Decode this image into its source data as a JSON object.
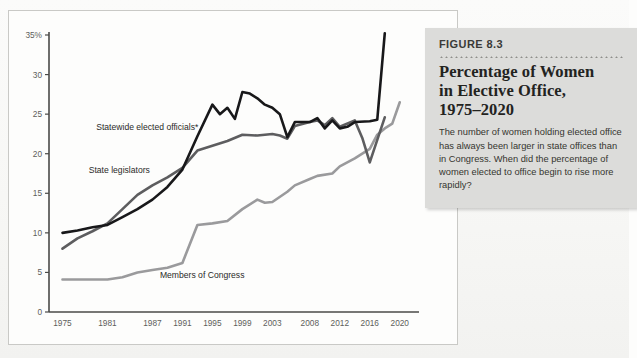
{
  "figure": {
    "label": "FIGURE 8.3",
    "title_lines": [
      "Percentage of Women",
      "in Elective Office,",
      "1975–2020"
    ],
    "caption": "The number of women holding elected office has always been larger in state offices than in Congress. When did the percentage of women elected to office begin to rise more rapidly?"
  },
  "colors": {
    "statewide": "#18181a",
    "legislators": "#5d5d5f",
    "congress": "#9a9a9c",
    "axis": "#4a4a48",
    "box_bg": "#dcdcda",
    "page_bg": "#fdfdfc"
  },
  "chart_data": {
    "type": "line",
    "xlabel": "",
    "ylabel": "",
    "ylim": [
      0,
      35
    ],
    "yticks": [
      0,
      5,
      10,
      15,
      20,
      25,
      30,
      35
    ],
    "ytick_labels": [
      "0",
      "5",
      "10",
      "15",
      "20",
      "25",
      "30",
      "35%"
    ],
    "grid": false,
    "legend": "inline-labels",
    "x": [
      1975,
      1981,
      1987,
      1991,
      1995,
      1999,
      2003,
      2008,
      2012,
      2016,
      2020
    ],
    "xtick_labels": [
      "1975",
      "1981",
      "1987",
      "1991",
      "1995",
      "1999",
      "2003",
      "2008",
      "2012",
      "2016",
      "2020"
    ],
    "series": [
      {
        "name": "Statewide elected officials*",
        "color": "#18181a",
        "label_x": 1979.5,
        "label_y": 23.0,
        "points": [
          [
            1975,
            10.0
          ],
          [
            1977,
            10.3
          ],
          [
            1979,
            10.7
          ],
          [
            1981,
            11.0
          ],
          [
            1983,
            12.0
          ],
          [
            1985,
            13.0
          ],
          [
            1987,
            14.2
          ],
          [
            1989,
            15.8
          ],
          [
            1991,
            18.0
          ],
          [
            1993,
            22.2
          ],
          [
            1995,
            26.2
          ],
          [
            1996,
            25.0
          ],
          [
            1997,
            25.8
          ],
          [
            1998,
            24.4
          ],
          [
            1999,
            27.8
          ],
          [
            2000,
            27.6
          ],
          [
            2001,
            27.0
          ],
          [
            2002,
            26.2
          ],
          [
            2003,
            25.8
          ],
          [
            2004,
            25.0
          ],
          [
            2005,
            22.1
          ],
          [
            2006,
            24.0
          ],
          [
            2008,
            24.0
          ],
          [
            2009,
            24.5
          ],
          [
            2010,
            23.2
          ],
          [
            2011,
            24.2
          ],
          [
            2012,
            23.2
          ],
          [
            2013,
            23.4
          ],
          [
            2014,
            24.0
          ],
          [
            2016,
            24.1
          ],
          [
            2017,
            24.3
          ],
          [
            2018,
            35.2
          ]
        ]
      },
      {
        "name": "State legislators",
        "color": "#5d5d5f",
        "label_x": 1978.5,
        "label_y": 17.6,
        "points": [
          [
            1975,
            8.0
          ],
          [
            1977,
            9.3
          ],
          [
            1979,
            10.2
          ],
          [
            1981,
            11.2
          ],
          [
            1983,
            13.0
          ],
          [
            1985,
            14.8
          ],
          [
            1987,
            16.0
          ],
          [
            1989,
            17.0
          ],
          [
            1991,
            18.2
          ],
          [
            1993,
            20.4
          ],
          [
            1995,
            21.0
          ],
          [
            1997,
            21.6
          ],
          [
            1999,
            22.4
          ],
          [
            2001,
            22.3
          ],
          [
            2003,
            22.5
          ],
          [
            2004,
            22.3
          ],
          [
            2005,
            21.9
          ],
          [
            2006,
            23.5
          ],
          [
            2008,
            24.0
          ],
          [
            2009,
            24.2
          ],
          [
            2010,
            23.6
          ],
          [
            2011,
            24.5
          ],
          [
            2012,
            23.4
          ],
          [
            2014,
            24.2
          ],
          [
            2015,
            22.0
          ],
          [
            2016,
            18.9
          ],
          [
            2018,
            24.6
          ]
        ]
      },
      {
        "name": "Members of Congress",
        "color": "#9a9a9c",
        "label_x": 1988.0,
        "label_y": 4.3,
        "points": [
          [
            1975,
            4.1
          ],
          [
            1981,
            4.1
          ],
          [
            1983,
            4.4
          ],
          [
            1985,
            5.0
          ],
          [
            1987,
            5.3
          ],
          [
            1989,
            5.6
          ],
          [
            1991,
            6.2
          ],
          [
            1993,
            11.0
          ],
          [
            1995,
            11.2
          ],
          [
            1997,
            11.5
          ],
          [
            1999,
            13.0
          ],
          [
            2001,
            14.2
          ],
          [
            2002,
            13.8
          ],
          [
            2003,
            13.9
          ],
          [
            2005,
            15.2
          ],
          [
            2006,
            16.0
          ],
          [
            2008,
            16.8
          ],
          [
            2009,
            17.2
          ],
          [
            2011,
            17.5
          ],
          [
            2012,
            18.4
          ],
          [
            2014,
            19.4
          ],
          [
            2016,
            20.6
          ],
          [
            2017,
            22.4
          ],
          [
            2018,
            23.2
          ],
          [
            2019,
            23.8
          ],
          [
            2020,
            26.5
          ]
        ]
      }
    ]
  }
}
